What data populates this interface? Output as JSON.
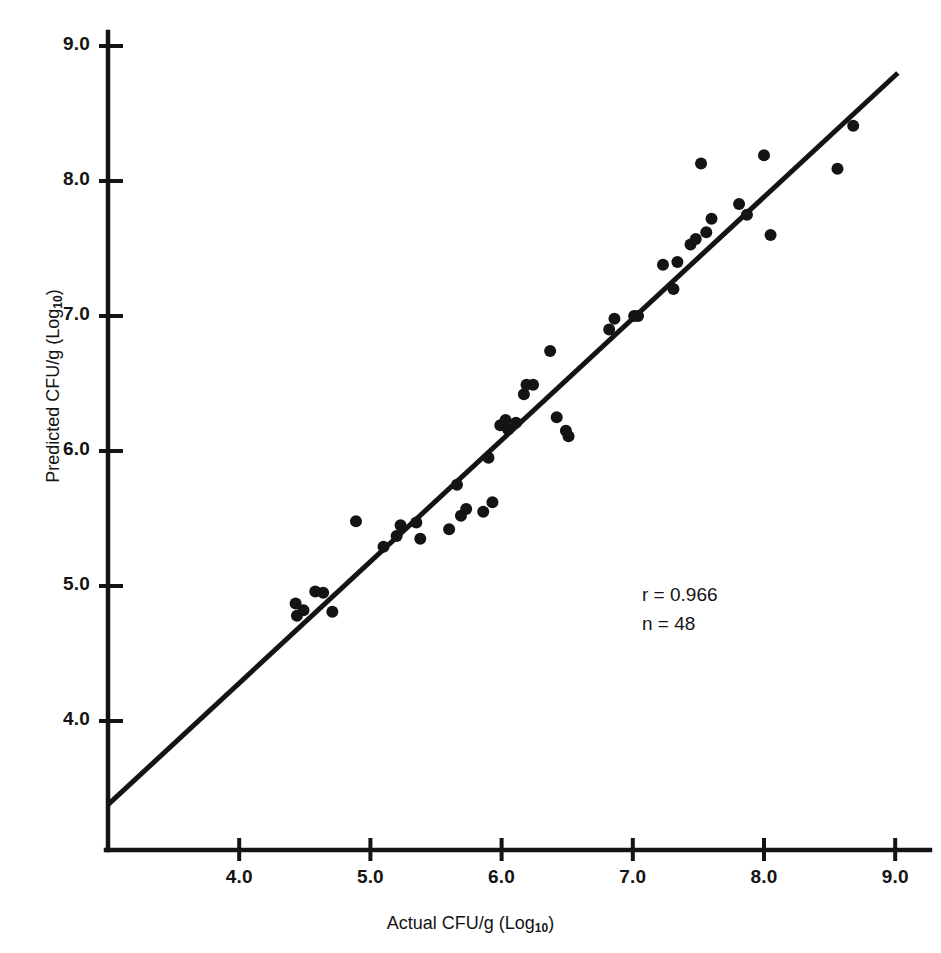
{
  "figure": {
    "background": "#ffffff",
    "ink_color": "#141414"
  },
  "annotations": {
    "r_label": "r = 0.966",
    "n_label": "n = 48"
  },
  "axes": {
    "x": {
      "title_prefix": "Actual CFU/g (Log",
      "title_sub": "10",
      "title_suffix": ")",
      "ticks": [
        "4.0",
        "5.0",
        "6.0",
        "7.0",
        "8.0",
        "9.0"
      ],
      "tick_values": [
        4.0,
        5.0,
        6.0,
        7.0,
        8.0,
        9.0
      ],
      "range": [
        3.0,
        9.2
      ]
    },
    "y": {
      "title_prefix": "Predicted CFU/g (Log",
      "title_sub": "10",
      "title_suffix": ")",
      "ticks": [
        "4.0",
        "5.0",
        "6.0",
        "7.0",
        "8.0",
        "9.0"
      ],
      "tick_values": [
        4.0,
        5.0,
        6.0,
        7.0,
        8.0,
        9.0
      ],
      "range": [
        3.0,
        9.1
      ]
    }
  },
  "chart_data": {
    "type": "scatter",
    "title": "",
    "subtitle": "",
    "xlabel": "Actual CFU/g (Log10)",
    "ylabel": "Predicted CFU/g (Log10)",
    "xlim": [
      3.0,
      9.2
    ],
    "ylim": [
      3.0,
      9.1
    ],
    "xticks": [
      4.0,
      5.0,
      6.0,
      7.0,
      8.0,
      9.0
    ],
    "yticks": [
      4.0,
      5.0,
      6.0,
      7.0,
      8.0,
      9.0
    ],
    "grid": false,
    "legend": "none",
    "annotations": [
      "r = 0.966",
      "n = 48"
    ],
    "correlation_r": 0.966,
    "n_points": 48,
    "marker": {
      "shape": "circle",
      "radius_px": 6,
      "color": "#141414"
    },
    "series": [
      {
        "name": "Observations",
        "x": [
          4.49,
          4.43,
          4.44,
          4.58,
          4.64,
          4.71,
          4.89,
          5.1,
          5.2,
          5.23,
          5.35,
          5.38,
          5.6,
          5.66,
          5.69,
          5.73,
          5.86,
          5.9,
          5.93,
          5.99,
          6.03,
          6.05,
          6.11,
          6.17,
          6.19,
          6.24,
          6.37,
          6.42,
          6.49,
          6.51,
          6.82,
          6.86,
          7.01,
          7.04,
          7.23,
          7.31,
          7.34,
          7.44,
          7.48,
          7.52,
          7.56,
          7.6,
          7.81,
          7.87,
          8.0,
          8.05,
          8.56,
          8.68
        ],
        "y": [
          4.82,
          4.87,
          4.78,
          4.96,
          4.95,
          4.81,
          5.48,
          5.29,
          5.37,
          5.45,
          5.47,
          5.35,
          5.42,
          5.75,
          5.52,
          5.57,
          5.55,
          5.95,
          5.62,
          6.19,
          6.23,
          6.16,
          6.21,
          6.42,
          6.49,
          6.49,
          6.74,
          6.25,
          6.15,
          6.11,
          6.9,
          6.98,
          7.0,
          7.0,
          7.38,
          7.2,
          7.4,
          7.53,
          7.57,
          8.13,
          7.62,
          7.72,
          7.83,
          7.75,
          8.19,
          7.6,
          8.09,
          8.41
        ],
        "color": "#141414"
      }
    ],
    "fit_line": {
      "type": "linear-regression",
      "x_start": 3.0,
      "y_start": 3.38,
      "x_end": 9.02,
      "y_end": 8.8,
      "color": "#141414",
      "width_px": 5
    }
  }
}
